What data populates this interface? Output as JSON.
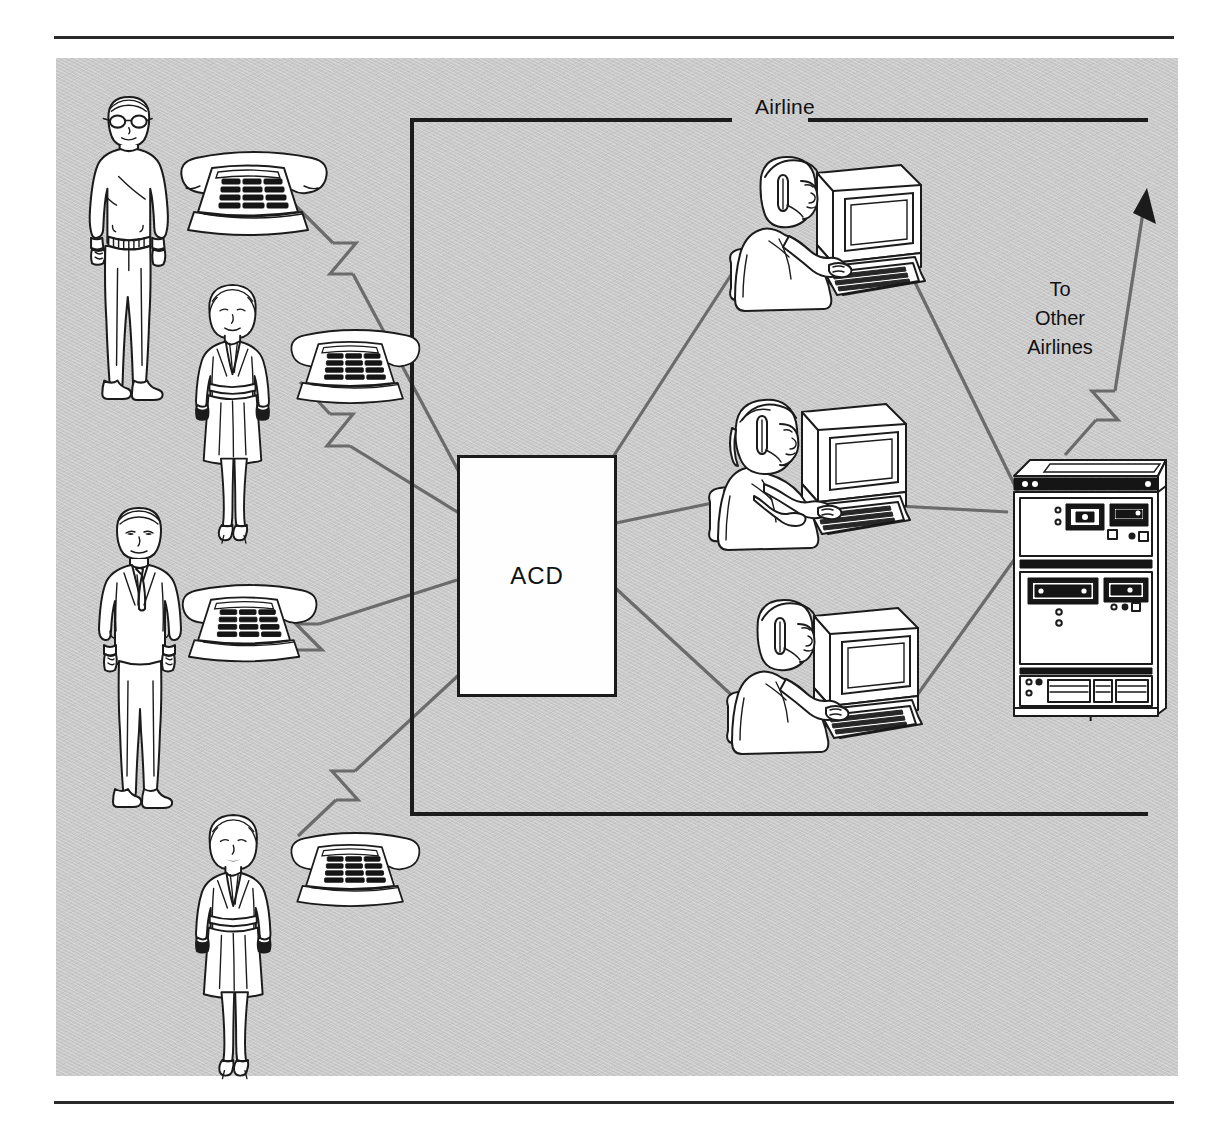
{
  "figure": {
    "type": "diagram",
    "background_color": "#c9c9c9",
    "ink_color": "#1b1b1b",
    "line_color": "#6b6b6b"
  },
  "boundary": {
    "label": "Airline",
    "style": "open bracket, label breaking the top edge"
  },
  "nodes": {
    "acd": {
      "label": "ACD",
      "shape": "rectangle",
      "fill": "#ffffff"
    },
    "computer": {
      "label": "Computer",
      "shape": "mainframe-cabinet"
    },
    "external": {
      "label": "To\nOther\nAirlines",
      "line1": "To",
      "line2": "Other",
      "line3": "Airlines"
    }
  },
  "callers": [
    {
      "id": "caller-1",
      "icon": "man-with-glasses-sweater",
      "phone": "desk-telephone"
    },
    {
      "id": "caller-2",
      "icon": "woman-business-suit",
      "phone": "desk-telephone"
    },
    {
      "id": "caller-3",
      "icon": "man-in-suit-and-tie",
      "phone": "desk-telephone"
    },
    {
      "id": "caller-4",
      "icon": "woman-business-suit",
      "phone": "desk-telephone"
    }
  ],
  "agents": [
    {
      "id": "agent-1",
      "icon": "headset-agent-at-terminal"
    },
    {
      "id": "agent-2",
      "icon": "headset-agent-at-terminal"
    },
    {
      "id": "agent-3",
      "icon": "headset-agent-at-terminal"
    }
  ],
  "connections": [
    {
      "from": "caller-1-phone",
      "to": "acd",
      "style": "lightning-break"
    },
    {
      "from": "caller-2-phone",
      "to": "acd",
      "style": "lightning-break"
    },
    {
      "from": "caller-3-phone",
      "to": "acd",
      "style": "lightning-break"
    },
    {
      "from": "caller-4-phone",
      "to": "acd",
      "style": "lightning-break"
    },
    {
      "from": "acd",
      "to": "agent-1",
      "style": "plain"
    },
    {
      "from": "acd",
      "to": "agent-2",
      "style": "plain"
    },
    {
      "from": "acd",
      "to": "agent-3",
      "style": "plain"
    },
    {
      "from": "agent-1",
      "to": "computer",
      "style": "plain"
    },
    {
      "from": "agent-2",
      "to": "computer",
      "style": "plain"
    },
    {
      "from": "agent-3",
      "to": "computer",
      "style": "plain"
    },
    {
      "from": "computer",
      "to": "external",
      "style": "lightning-break-arrow"
    }
  ]
}
